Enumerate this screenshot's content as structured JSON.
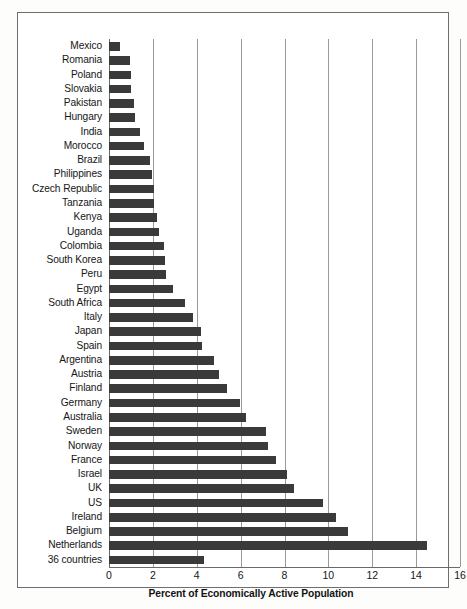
{
  "chart_data": {
    "type": "bar",
    "orientation": "horizontal",
    "title": "",
    "xlabel": "Percent of Economically Active Population",
    "ylabel": "",
    "xlim": [
      0,
      16
    ],
    "xticks": [
      0,
      2,
      4,
      6,
      8,
      10,
      12,
      14,
      16
    ],
    "grid": true,
    "legend": null,
    "bar_color": "#3a3a3a",
    "categories": [
      "Mexico",
      "Romania",
      "Poland",
      "Slovakia",
      "Pakistan",
      "Hungary",
      "India",
      "Morocco",
      "Brazil",
      "Philippines",
      "Czech Republic",
      "Tanzania",
      "Kenya",
      "Uganda",
      "Colombia",
      "South Korea",
      "Peru",
      "Egypt",
      "South Africa",
      "Italy",
      "Japan",
      "Spain",
      "Argentina",
      "Austria",
      "Finland",
      "Germany",
      "Australia",
      "Sweden",
      "Norway",
      "France",
      "Israel",
      "UK",
      "US",
      "Ireland",
      "Belgium",
      "Netherlands",
      "36 countries"
    ],
    "values": [
      0.5,
      0.95,
      1.0,
      1.0,
      1.15,
      1.2,
      1.4,
      1.6,
      1.85,
      1.95,
      2.05,
      2.05,
      2.2,
      2.3,
      2.5,
      2.55,
      2.6,
      2.9,
      3.45,
      3.85,
      4.2,
      4.25,
      4.8,
      5.0,
      5.4,
      5.95,
      6.25,
      7.15,
      7.25,
      7.6,
      8.1,
      8.45,
      9.75,
      10.35,
      10.9,
      14.5,
      4.35
    ]
  }
}
